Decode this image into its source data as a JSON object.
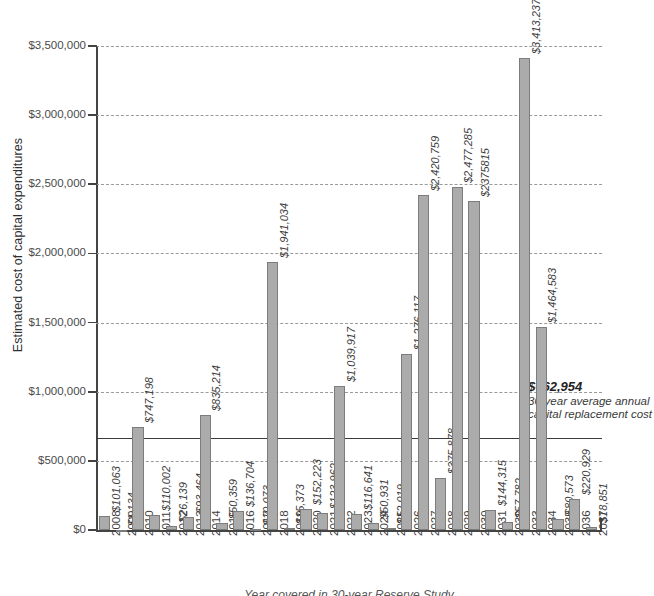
{
  "chart_data": {
    "type": "bar",
    "title": "",
    "xlabel": "",
    "ylabel": "Estimated cost of capital expenditures",
    "ylim": [
      0,
      3500000
    ],
    "ytick_labels": [
      "$3,500,000",
      "$3,000,000",
      "$2,500,000",
      "$2,000,000",
      "$1,500,000",
      "$1,000,000",
      "$500,000",
      "$0"
    ],
    "ytick_values": [
      3500000,
      3000000,
      2500000,
      2000000,
      1500000,
      1000000,
      500000,
      0
    ],
    "grid": true,
    "legend": "none",
    "categories": [
      "2008",
      "2009",
      "2010",
      "2011",
      "2012",
      "2013",
      "2014",
      "2015",
      "2016",
      "2017",
      "2018",
      "2019",
      "2020",
      "2021",
      "2022",
      "2023",
      "2024",
      "2025",
      "2026",
      "2027",
      "2028",
      "2029",
      "2030",
      "2031",
      "2032",
      "2033",
      "2034",
      "2035",
      "2036",
      "2037"
    ],
    "values": [
      101063,
      1134,
      747198,
      110002,
      26139,
      93464,
      835214,
      50359,
      136704,
      10073,
      1941034,
      15373,
      152223,
      123962,
      1039917,
      116641,
      50931,
      12019,
      1276117,
      2420759,
      375878,
      2477285,
      2375815,
      144315,
      57782,
      3413237,
      1464583,
      80573,
      220929,
      18851
    ],
    "value_labels": [
      "$101,063",
      "$1,134",
      "$747,198",
      "$110,002",
      "$26,139",
      "$93,464",
      "$835,214",
      "$50,359",
      "$136,704",
      "$10,073",
      "$1,941,034",
      "$15,373",
      "$152,223",
      "$123,962",
      "$1,039,917",
      "$116,641",
      "$50,931",
      "$12,019",
      "$1,276,117",
      "$2,420,759",
      "$375,878",
      "$2,477,285",
      "$2375815",
      "$144,315",
      "$57,782",
      "$3,413,237",
      "$1,464,583",
      "$80,573",
      "$220,929",
      "$18,851"
    ],
    "reference_line": {
      "value": 662954,
      "amount_label": "$662,954",
      "description": "30-year average annual capital replacement cost"
    },
    "colors": {
      "bar_fill": "#ababab",
      "bar_stroke": "#7c7c7c",
      "axis": "#444444",
      "gridline": "#9a9a9a",
      "reference_line": "#3a3a3a",
      "text": "#3f3f3f",
      "background": "#ffffff"
    }
  },
  "caption": "Year covered in 30-year Reserve Study"
}
